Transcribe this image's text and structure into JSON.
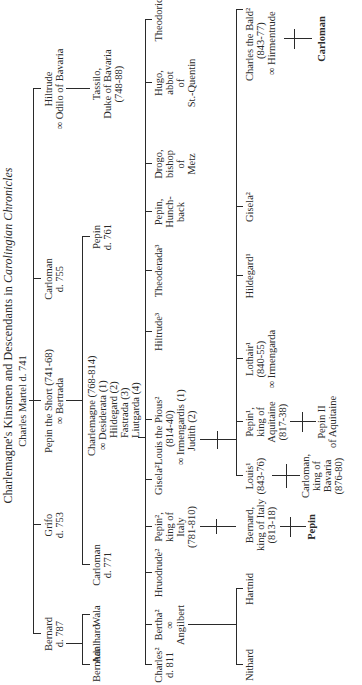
{
  "title": {
    "main": "Charlemagne's Kinsmen and Descendants in ",
    "italic": "Carolingian Chronicles"
  },
  "gen0": {
    "charles_martel": "Charles Martel d. 741"
  },
  "gen1": {
    "bernard": [
      "Bernard",
      "d. 787"
    ],
    "grifo": [
      "Grifo",
      "d. 753"
    ],
    "pepin_short": [
      "Pepin the Short (741-68)",
      "∞ Bertrada"
    ],
    "carloman": [
      "Carloman",
      "d. 755"
    ],
    "hiltrude": [
      "Hiltrude",
      "∞ Odilo of Bavaria"
    ]
  },
  "gen2": {
    "bernhar": "Bernhar",
    "adalhard": "Adalhard",
    "wala": "Wala",
    "carloman": [
      "Carloman",
      "d. 771"
    ],
    "charlemagne": [
      "Charlemagne (768-814)",
      "∞ Desiderata (1)",
      "Hildegard (2)",
      "Fastrada (3)",
      "Liutgarda (4)"
    ],
    "pepin": [
      "Pepin",
      "d. 761"
    ],
    "tassilo": [
      "Tassilo,",
      "Duke of Bavaria",
      "(748-88)"
    ]
  },
  "gen3": {
    "charles": [
      "Charles²",
      "d. 811"
    ],
    "bertha": [
      "Bertha²",
      "∞",
      "Angilbert"
    ],
    "hruodrude": "Hruodrude²",
    "pepin_italy": [
      "Pepin²,",
      "king of",
      "Italy",
      "(781-810)"
    ],
    "gisela": "Gisela²",
    "louis_pious": [
      "Louis the Pious²",
      "(814-40)",
      "∞ Irmengardis (1)",
      "Judith (2)"
    ],
    "hiltrude": "Hiltrude³",
    "theoderada": "Theoderada³",
    "pepin_hunchback": [
      "Pepin,",
      "Hunch-",
      "back"
    ],
    "drogo": [
      "Drogo,",
      "bishop",
      "of",
      "Metz"
    ],
    "hugo": [
      "Hugo,",
      "abbot",
      "of",
      "St.-Quentin"
    ],
    "theodoric": "Theodoric"
  },
  "gen4": {
    "nithard": "Nithard",
    "hartnid": "Hartnid",
    "bernard_italy": [
      "Bernard,",
      "king of Italy",
      "(813-18)"
    ],
    "louis": [
      "Louis¹",
      "(843-76)"
    ],
    "pepin_aquitaine": [
      "Pepin¹,",
      "king of",
      "Aquitaine",
      "(817-38)"
    ],
    "lothair": [
      "Lothair¹",
      "(840-55)",
      "∞ Irmengarda"
    ],
    "hildegard": "Hildegard¹",
    "gisela": "Gisela²",
    "charles_bald": [
      "Charles the Bald²",
      "(843-77)",
      "∞ Hirmentrude"
    ]
  },
  "gen5": {
    "pepin": "Pepin",
    "carloman_bavaria": [
      "Carloman,",
      "king of",
      "Bavaria",
      "(876-80)"
    ],
    "pepin_ii": [
      "Pepin II",
      "of Aquitaine"
    ],
    "carloman": "Carloman"
  }
}
